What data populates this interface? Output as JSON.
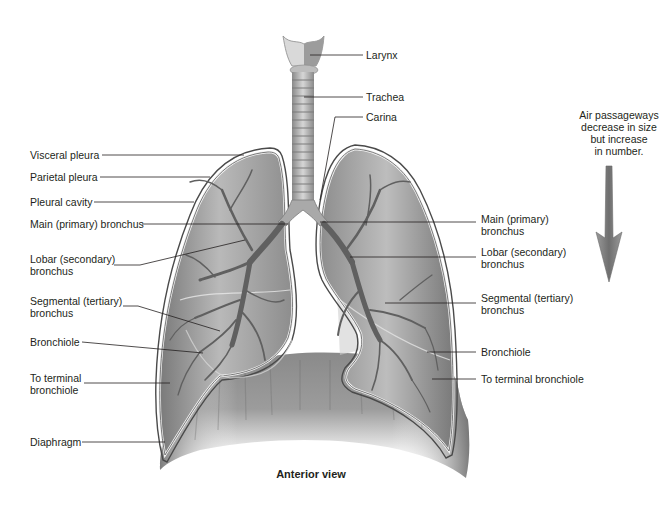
{
  "figure": {
    "caption": "Anterior view",
    "note": "Air passageways decrease in size but increase in number.",
    "colors": {
      "lung_fill": "#8f8f8f",
      "lung_light": "#c9c9c9",
      "pleura_outline": "#5a5a5a",
      "bronchi": "#6a6a6a",
      "diaphragm": "#7d7d7d",
      "arrow": "#8a8a8a",
      "leader_line": "#231f20"
    }
  },
  "labels_left": [
    {
      "id": "visceral-pleura",
      "text": "Visceral pleura"
    },
    {
      "id": "parietal-pleura",
      "text": "Parietal pleura"
    },
    {
      "id": "pleural-cavity",
      "text": "Pleural cavity"
    },
    {
      "id": "main-bronchus-left",
      "text": "Main (primary) bronchus"
    },
    {
      "id": "lobar-bronchus-left",
      "line1": "Lobar (secondary)",
      "line2": "bronchus"
    },
    {
      "id": "segmental-bronchus-left",
      "line1": "Segmental (tertiary)",
      "line2": "bronchus"
    },
    {
      "id": "bronchiole-left",
      "text": "Bronchiole"
    },
    {
      "id": "terminal-bronchiole-left",
      "line1": "To terminal",
      "line2": "bronchiole"
    },
    {
      "id": "diaphragm",
      "text": "Diaphragm"
    }
  ],
  "labels_top": [
    {
      "id": "larynx",
      "text": "Larynx"
    },
    {
      "id": "trachea",
      "text": "Trachea"
    },
    {
      "id": "carina",
      "text": "Carina"
    }
  ],
  "labels_right": [
    {
      "id": "main-bronchus-right",
      "line1": "Main (primary)",
      "line2": "bronchus"
    },
    {
      "id": "lobar-bronchus-right",
      "line1": "Lobar (secondary)",
      "line2": "bronchus"
    },
    {
      "id": "segmental-bronchus-right",
      "line1": "Segmental (tertiary)",
      "line2": "bronchus"
    },
    {
      "id": "bronchiole-right",
      "text": "Bronchiole"
    },
    {
      "id": "terminal-bronchiole-right",
      "text": "To terminal bronchiole"
    }
  ],
  "note_lines": [
    "Air passageways",
    "decrease in size",
    "but increase",
    "in number."
  ]
}
